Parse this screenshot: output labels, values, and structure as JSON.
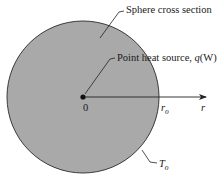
{
  "diagram": {
    "labels": {
      "sphere": "Sphere cross section",
      "source_prefix": "Point heat source, ",
      "source_q": "q",
      "source_unit": "(W)",
      "origin": "0",
      "outer_radius_main": "r",
      "outer_radius_sub": "o",
      "axis": "r",
      "temp_main": "T",
      "temp_sub": "o"
    },
    "colors": {
      "sphere_fill": "#a9a9a9",
      "sphere_stroke": "#3a3a3a",
      "line": "#222222",
      "text": "#1a1a1a"
    }
  }
}
